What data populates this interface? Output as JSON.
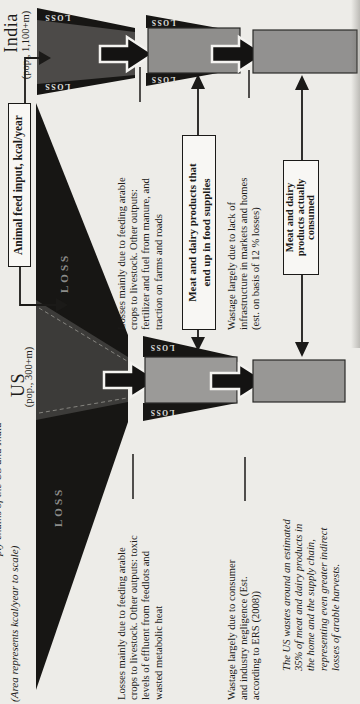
{
  "page": {
    "area_note": "(Area represents kcal/year to scale)",
    "caption_fragment": "ply chains of the US and India",
    "feed_input_label": "Animal feed input, kcal/year",
    "loss_label": "LOSS",
    "colors": {
      "page_bg": "#edece8",
      "ink": "#1c1b19",
      "funnel_black": "#171614",
      "us_funnel_gray": "#3c3b39",
      "india_funnel_gray": "#4c4a48",
      "stage_box_gray": "#969593",
      "label_box_bg": "#f8f7f4"
    },
    "us": {
      "name": "US",
      "population": "(pop., 300+m)",
      "losses_lines": [
        "Losses mainly due to feeding arable",
        "crops to livestock. Other outputs: toxic",
        "levels of effluent from feedlots and",
        "wasted metabolic heat"
      ],
      "wastage_lines": [
        "Wastage largely due to consumer",
        "and industry negligence (Est.",
        "according to ERS (2008))"
      ],
      "note_lines": [
        "The US wastes around an estimated",
        "35% of meat and dairy products in",
        "the home and the supply chain,",
        "representing even greater indirect",
        "losses of arable harvests."
      ]
    },
    "india": {
      "name": "India",
      "population": "(pop., 1,100+m)",
      "losses_lines": [
        "Losses mainly due to feeding arable",
        "crops to livestock. Other outputs:",
        "fertilizer and fuel from manure, and",
        "traction on farms and roads"
      ],
      "wastage_lines": [
        "Wastage largely due to lack of",
        "infrastructure in markets and homes",
        "(est. on basis of 12 % losses)"
      ]
    },
    "labels": {
      "food_supplies_lines": [
        "Meat and dairy products that",
        "end up in food supplies"
      ],
      "consumed_lines": [
        "Meat and dairy",
        "products actually",
        "consumed"
      ]
    }
  }
}
